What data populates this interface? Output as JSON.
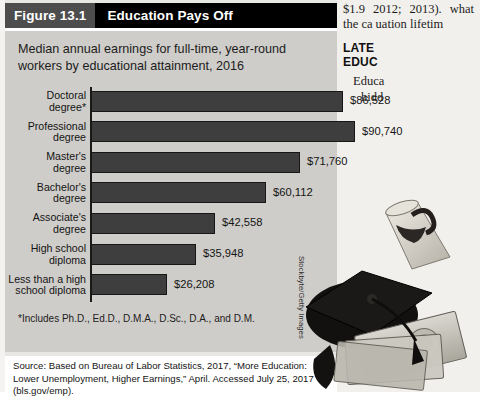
{
  "figure": {
    "number": "Figure 13.1",
    "title": "Education Pays Off",
    "subtitle": "Median annual earnings for full-time, year-round workers by educational attainment, 2016",
    "footnote": "*Includes Ph.D., Ed.D., D.M.A., D.Sc., D.A., and D.M.",
    "source": "Source: Based on Bureau of Labor Statistics, 2017, “More Education: Lower Unemployment, Higher Earnings,” April. Accessed July 25, 2017 (bls.gov/emp).",
    "photo_credit": "Stockbyte/Getty Images",
    "photo_alt": "graduation-cap-diploma-and-money-photo",
    "colors": {
      "bar": "#3f3e3e",
      "panel": "#cfcdc9",
      "header_number_bg": "#4d4d4d",
      "header_title_bg": "#000000",
      "axis": "#1a1a1a"
    }
  },
  "chart_data": {
    "type": "bar",
    "orientation": "horizontal",
    "title": "Education Pays Off",
    "subtitle": "Median annual earnings for full-time, year-round workers by educational attainment, 2016",
    "xlabel": "",
    "ylabel": "",
    "grid": false,
    "legend": false,
    "xlim": [
      0,
      90740
    ],
    "categories": [
      "Doctoral degree*",
      "Professional degree",
      "Master's degree",
      "Bachelor's degree",
      "Associate's degree",
      "High school diploma",
      "Less than a high school diploma"
    ],
    "values": [
      86528,
      90740,
      71760,
      60112,
      42558,
      35948,
      26208
    ],
    "value_labels": [
      "$86,528",
      "$90,740",
      "$71,760",
      "$60,112",
      "$42,558",
      "$35,948",
      "$26,208"
    ],
    "bars": [
      {
        "label_line1": "Doctoral",
        "label_line2": "degree*",
        "value": 86528,
        "value_label": "$86,528"
      },
      {
        "label_line1": "Professional",
        "label_line2": "degree",
        "value": 90740,
        "value_label": "$90,740"
      },
      {
        "label_line1": "Master's",
        "label_line2": "degree",
        "value": 71760,
        "value_label": "$71,760"
      },
      {
        "label_line1": "Bachelor's",
        "label_line2": "degree",
        "value": 60112,
        "value_label": "$60,112"
      },
      {
        "label_line1": "Associate's",
        "label_line2": "degree",
        "value": 42558,
        "value_label": "$42,558"
      },
      {
        "label_line1": "High school",
        "label_line2": "diploma",
        "value": 35948,
        "value_label": "$35,948"
      },
      {
        "label_line1": "Less than a high",
        "label_line2": "school diploma",
        "value": 26208,
        "value_label": "$26,208"
      }
    ]
  },
  "book_column": {
    "para_top": "$1.9 2012; 2013). what the ca uation lifetim",
    "heading_line1": "LATE",
    "heading_line2": "EDUC",
    "para_bottom_line1": "Educa",
    "para_bottom_line2": "hidd"
  }
}
